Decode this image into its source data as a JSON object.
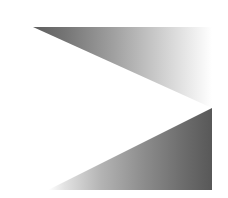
{
  "artwork": {
    "title": "Chevron gradient graphic",
    "description": "Abstract right-pointing chevron formed by two gradient-shaded triangles on a white background",
    "canvas": {
      "width": 228,
      "height": 198,
      "background_color": "#ffffff"
    },
    "shapes": [
      {
        "name": "upper-triangle",
        "points": "33,27 212,27 212,108",
        "gradient": {
          "direction": "left-to-right",
          "stops": [
            {
              "offset": "0%",
              "color": "#5e5e5e"
            },
            {
              "offset": "18%",
              "color": "#757575"
            },
            {
              "offset": "45%",
              "color": "#a0a0a0"
            },
            {
              "offset": "72%",
              "color": "#cfcfcf"
            },
            {
              "offset": "90%",
              "color": "#eeeeee"
            },
            {
              "offset": "100%",
              "color": "#ffffff"
            }
          ]
        }
      },
      {
        "name": "lower-triangle",
        "points": "212,108 212,190 48,190",
        "gradient": {
          "direction": "left-to-right",
          "stops": [
            {
              "offset": "0%",
              "color": "#ffffff"
            },
            {
              "offset": "10%",
              "color": "#e2e2e2"
            },
            {
              "offset": "32%",
              "color": "#b4b4b4"
            },
            {
              "offset": "58%",
              "color": "#8d8d8d"
            },
            {
              "offset": "82%",
              "color": "#6d6d6d"
            },
            {
              "offset": "100%",
              "color": "#585858"
            }
          ]
        }
      }
    ],
    "palette": {
      "darkest": "#585858",
      "mid": "#a0a0a0",
      "lightest": "#ffffff"
    }
  }
}
